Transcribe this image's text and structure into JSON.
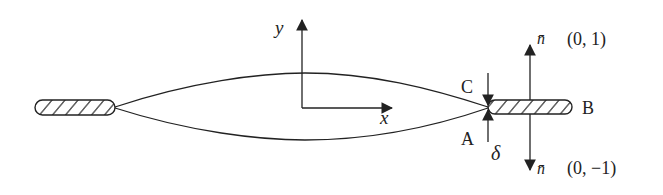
{
  "diagram": {
    "type": "crack-with-slit-schematic",
    "colors": {
      "stroke": "#222222",
      "background": "#ffffff"
    },
    "axes": {
      "y_label": "y",
      "x_label": "x"
    },
    "points": {
      "C": "C",
      "A": "A",
      "B": "B"
    },
    "gap_label": "δ",
    "normals": {
      "up": {
        "symbol": "n̄",
        "vector": "(0, 1)"
      },
      "down": {
        "symbol": "n̄",
        "vector": "(0, −1)"
      }
    },
    "elements": [
      "left-hatched-slit",
      "crack-upper-face",
      "crack-lower-face",
      "right-hatched-slit",
      "coordinate-axes",
      "normal-vector-arrows",
      "gap-delta-arrows"
    ]
  }
}
